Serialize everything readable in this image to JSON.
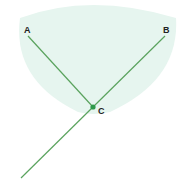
{
  "diagram": {
    "points": {
      "A": {
        "label": "A",
        "x": 28,
        "y": 36,
        "label_x": 24,
        "label_y": 33
      },
      "B": {
        "label": "B",
        "x": 165,
        "y": 36,
        "label_x": 163,
        "label_y": 33
      },
      "C": {
        "label": "C",
        "x": 93,
        "y": 107,
        "label_x": 98,
        "label_y": 114
      }
    },
    "ray_end": {
      "x": 21,
      "y": 178
    },
    "colors": {
      "line": "#5aa35e",
      "point": "#2e9a4a",
      "region": "#e6f5ef"
    }
  }
}
